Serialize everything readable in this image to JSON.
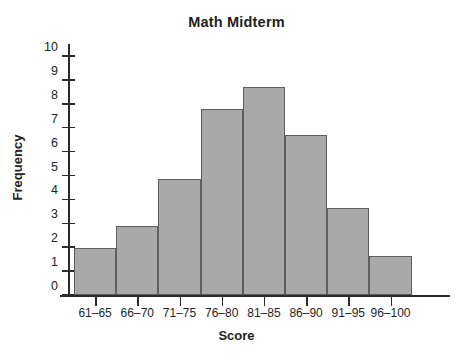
{
  "chart_data": {
    "type": "bar",
    "title": "Math Midterm",
    "xlabel": "Score",
    "ylabel": "Frequency",
    "categories": [
      "61–65",
      "66–70",
      "71–75",
      "76–80",
      "81–85",
      "86–90",
      "91–95",
      "96–100"
    ],
    "values": [
      1.95,
      2.9,
      4.85,
      7.8,
      8.7,
      6.7,
      3.65,
      1.65
    ],
    "ylim": [
      0,
      10
    ],
    "yticks": [
      0,
      1,
      2,
      3,
      4,
      5,
      6,
      7,
      8,
      9,
      10
    ],
    "ytick_labels": [
      "0",
      "1",
      "2",
      "3",
      "4",
      "5",
      "6",
      "7",
      "8",
      "9",
      "10"
    ],
    "grid": false,
    "legend": null,
    "bar_fill_color": "#a9a9a9",
    "bar_edge_color": "#5e5e5e",
    "axis_color": "#2b2b2b"
  }
}
